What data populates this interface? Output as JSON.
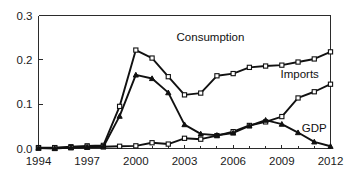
{
  "chart_data": {
    "type": "line",
    "title": "",
    "xlabel": "",
    "ylabel": "",
    "xlim": [
      1994,
      2012
    ],
    "ylim": [
      0.0,
      0.3
    ],
    "grid": false,
    "legend_position": "inline-right-of-series",
    "xticks": [
      "1994",
      "1997",
      "2000",
      "2003",
      "2006",
      "2009",
      "2012"
    ],
    "xtick_values": [
      1994,
      1997,
      2000,
      2003,
      2006,
      2009,
      2012
    ],
    "xtick_minor_values": [
      1995,
      1996,
      1998,
      1999,
      2001,
      2002,
      2004,
      2005,
      2007,
      2008,
      2010,
      2011
    ],
    "yticks": [
      "0.0",
      "0.1",
      "0.2",
      "0.3"
    ],
    "ytick_values": [
      0.0,
      0.1,
      0.2,
      0.3
    ],
    "x": [
      1994,
      1995,
      1996,
      1997,
      1998,
      1999,
      2000,
      2001,
      2002,
      2003,
      2004,
      2005,
      2006,
      2007,
      2008,
      2009,
      2010,
      2011,
      2012
    ],
    "series": [
      {
        "name": "Consumption",
        "marker": "square",
        "label_x": 2004.6,
        "label_y": 0.243,
        "values": [
          0.002,
          0.002,
          0.004,
          0.006,
          0.007,
          0.095,
          0.222,
          0.204,
          0.162,
          0.121,
          0.125,
          0.164,
          0.169,
          0.183,
          0.186,
          0.188,
          0.195,
          0.202,
          0.218
        ]
      },
      {
        "name": "Imports",
        "marker": "square",
        "label_x": 2010.1,
        "label_y": 0.16,
        "values": [
          0.001,
          0.001,
          0.002,
          0.003,
          0.004,
          0.005,
          0.006,
          0.013,
          0.01,
          0.023,
          0.021,
          0.029,
          0.038,
          0.052,
          0.06,
          0.072,
          0.114,
          0.128,
          0.145
        ]
      },
      {
        "name": "GDP",
        "marker": "triangle",
        "label_x": 2011.0,
        "label_y": 0.037,
        "values": [
          0.001,
          0.0,
          0.002,
          0.003,
          0.004,
          0.073,
          0.166,
          0.158,
          0.126,
          0.054,
          0.033,
          0.03,
          0.035,
          0.051,
          0.064,
          0.055,
          0.036,
          0.015,
          0.005
        ]
      }
    ]
  }
}
